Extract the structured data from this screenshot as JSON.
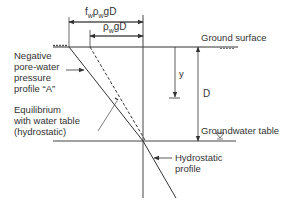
{
  "diagram": {
    "dimension_labels": {
      "outer": "fwρwgD",
      "outer_sub": {
        "f": "f",
        "w1": "w",
        "rho": "ρ",
        "w2": "w",
        "gD": "gD"
      },
      "inner": "ρwgD",
      "inner_sub": {
        "rho": "ρ",
        "w": "w",
        "gD": "gD"
      }
    },
    "labels": {
      "ground_surface": "Ground surface",
      "groundwater_table": "Groundwater table",
      "y": "y",
      "D": "D",
      "negative_profile": [
        "Negative",
        "pore-water",
        "pressure",
        "profile “A”"
      ],
      "equilibrium": [
        "Equilibrium",
        "with water table",
        "(hydrostatic)"
      ],
      "hydrostatic": [
        "Hydrostatic",
        "profile"
      ]
    },
    "colors": {
      "line": "#333333",
      "text": "#333333",
      "background": "#ffffff"
    }
  }
}
